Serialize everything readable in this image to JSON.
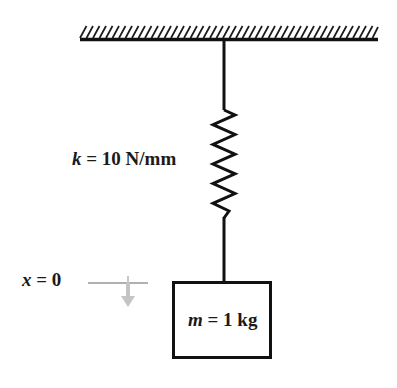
{
  "diagram": {
    "type": "free-body-schematic",
    "colors": {
      "ink": "#1a1a1a",
      "line": "#111111",
      "datum_gray": "#b0b0b0",
      "arrow_gray": "#c4c4c4",
      "background": "#ffffff"
    },
    "ceiling": {
      "name": "fixed-support",
      "hatch_count": 46,
      "bar_x_start": 80,
      "bar_x_end": 378,
      "bar_y": 39
    },
    "spring": {
      "name": "coil-spring",
      "label_symbol": "k",
      "label_equals": "=",
      "label_value": "10",
      "label_unit": "N/mm",
      "label_text": "k = 10 N/mm",
      "coil_count": 11,
      "top_y": 110,
      "bottom_y": 218,
      "amplitude_px": 11
    },
    "rod": {
      "name": "connecting-rod",
      "x": 224,
      "top_y": 39,
      "bottom_y": 281
    },
    "mass": {
      "name": "mass-block",
      "label_symbol": "m",
      "label_equals": "=",
      "label_value": "1",
      "label_unit": "kg",
      "label_text": "m = 1 kg",
      "left": 172,
      "top": 281,
      "right": 272,
      "bottom": 359
    },
    "datum": {
      "name": "equilibrium-reference",
      "label_symbol": "x",
      "label_equals": "=",
      "label_value": "0",
      "label_text": "x = 0",
      "line_x_start": 88,
      "line_x_end": 148,
      "line_y": 283,
      "arrow_direction": "down",
      "arrow_x": 128,
      "arrow_tip_y": 306
    }
  }
}
